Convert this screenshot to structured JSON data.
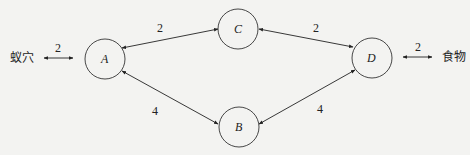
{
  "diagram": {
    "type": "network-graph",
    "endpoints": {
      "left": {
        "label": "蚁穴",
        "edge_weight": "2"
      },
      "right": {
        "label": "食物",
        "edge_weight": "2"
      }
    },
    "nodes": [
      {
        "id": "A",
        "label": "A"
      },
      {
        "id": "B",
        "label": "B"
      },
      {
        "id": "C",
        "label": "C"
      },
      {
        "id": "D",
        "label": "D"
      }
    ],
    "edges": [
      {
        "from": "蚁穴",
        "to": "A",
        "weight": "2",
        "bidirectional": true
      },
      {
        "from": "A",
        "to": "C",
        "weight": "2",
        "bidirectional": true
      },
      {
        "from": "C",
        "to": "D",
        "weight": "2",
        "bidirectional": true
      },
      {
        "from": "A",
        "to": "B",
        "weight": "4",
        "bidirectional": true
      },
      {
        "from": "B",
        "to": "D",
        "weight": "4",
        "bidirectional": true
      },
      {
        "from": "D",
        "to": "食物",
        "weight": "2",
        "bidirectional": true
      }
    ]
  }
}
